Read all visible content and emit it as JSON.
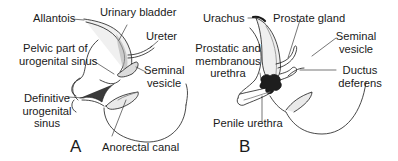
{
  "figure": {
    "panels": [
      {
        "id": "A",
        "letter": "A",
        "labels": {
          "allantois": "Allantois",
          "urinary_bladder": "Urinary bladder",
          "ureter": "Ureter",
          "pelvic_part_1": "Pelvic part of",
          "pelvic_part_2": "urogenital sinus",
          "seminal_vesicle_1": "Seminal",
          "seminal_vesicle_2": "vesicle",
          "definitive_1": "Definitive",
          "definitive_2": "urogenital",
          "definitive_3": "sinus",
          "anorectal_canal": "Anorectal canal"
        }
      },
      {
        "id": "B",
        "letter": "B",
        "labels": {
          "urachus": "Urachus",
          "prostate_gland": "Prostate gland",
          "prostatic_1": "Prostatic and",
          "prostatic_2": "membranous",
          "prostatic_3": "urethra",
          "seminal_vesicle_1": "Seminal",
          "seminal_vesicle_2": "vesicle",
          "ductus_1": "Ductus",
          "ductus_2": "deferens",
          "penile_urethra": "Penile urethra"
        }
      }
    ],
    "colors": {
      "line": "#1a1a1a",
      "fill": "#f2f2f2",
      "shade": "#9a9a9a",
      "background": "#ffffff"
    }
  }
}
